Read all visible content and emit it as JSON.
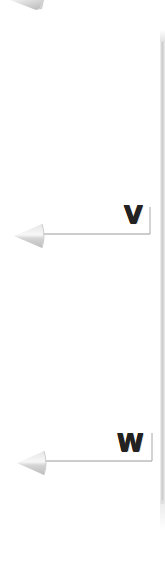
{
  "diagram": {
    "type": "labeled-callout-arrows",
    "background": "#ffffff",
    "line_color": "#9a9a9a",
    "label_color": "#222222",
    "arrowhead_color": "#cfcfcf",
    "callouts": [
      {
        "id": "V",
        "label": "V",
        "direction": "left"
      },
      {
        "id": "W",
        "label": "W",
        "direction": "left"
      }
    ],
    "partial_arrow_top_left": true,
    "right_edge_bar": true
  }
}
